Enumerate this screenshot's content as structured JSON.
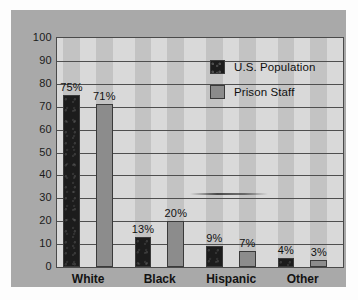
{
  "chart_data": {
    "type": "bar",
    "title": "",
    "xlabel": "",
    "ylabel": "",
    "ylim": [
      0,
      100
    ],
    "ytick_labels": [
      "100",
      "90",
      "80",
      "70",
      "60",
      "50",
      "40",
      "30",
      "20",
      "10",
      "0"
    ],
    "ytick_values": [
      100,
      90,
      80,
      70,
      60,
      50,
      40,
      30,
      20,
      10,
      0
    ],
    "grid": true,
    "legend_position": "upper right",
    "categories": [
      "White",
      "Black",
      "Hispanic",
      "Other"
    ],
    "series": [
      {
        "name": "U.S. Population",
        "color": "#1c1c1c",
        "values": [
          75,
          13,
          9,
          4
        ],
        "data_labels": [
          "75%",
          "13%",
          "9%",
          "4%"
        ]
      },
      {
        "name": "Prison Staff",
        "color": "#8c8c8c",
        "values": [
          71,
          20,
          7,
          3
        ],
        "data_labels": [
          "71%",
          "20%",
          "7%",
          "3%"
        ]
      }
    ]
  },
  "style": {
    "panel_color": "#a9a9a9",
    "plot_background": "#d9d9d9",
    "band_color": "#c3c3c3",
    "gridline_color": "#4f4f4f",
    "axis_color": "#4a4a4a",
    "text_color": "#121212"
  }
}
